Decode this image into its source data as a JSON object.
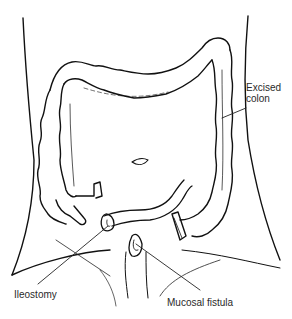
{
  "diagram": {
    "type": "medical-illustration",
    "stroke_color": "#111111",
    "background_color": "#ffffff",
    "labels": {
      "excised_colon_line1": "Excised",
      "excised_colon_line2": "colon",
      "ileostomy": "Ileostomy",
      "mucosal_fistula": "Mucosal fistula"
    }
  }
}
